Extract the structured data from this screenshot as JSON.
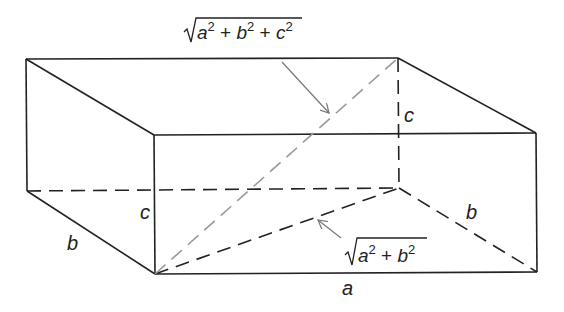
{
  "diagram": {
    "colors": {
      "edge": "#222222",
      "space_diagonal": "#999999",
      "base_diagonal": "#222222",
      "arrow": "#777777"
    },
    "labels": {
      "a": "a",
      "b_left": "b",
      "b_right": "b",
      "c_front": "c",
      "c_back": "c"
    },
    "annotations": {
      "space_diagonal": {
        "root": "√",
        "terms": [
          "a",
          "2",
          " + ",
          "b",
          "2",
          " + ",
          "c",
          "2"
        ],
        "text": "√(a² + b² + c²)"
      },
      "base_diagonal": {
        "root": "√",
        "terms": [
          "a",
          "2",
          " + ",
          "b",
          "2"
        ],
        "text": "√(a² + b²)"
      }
    }
  }
}
